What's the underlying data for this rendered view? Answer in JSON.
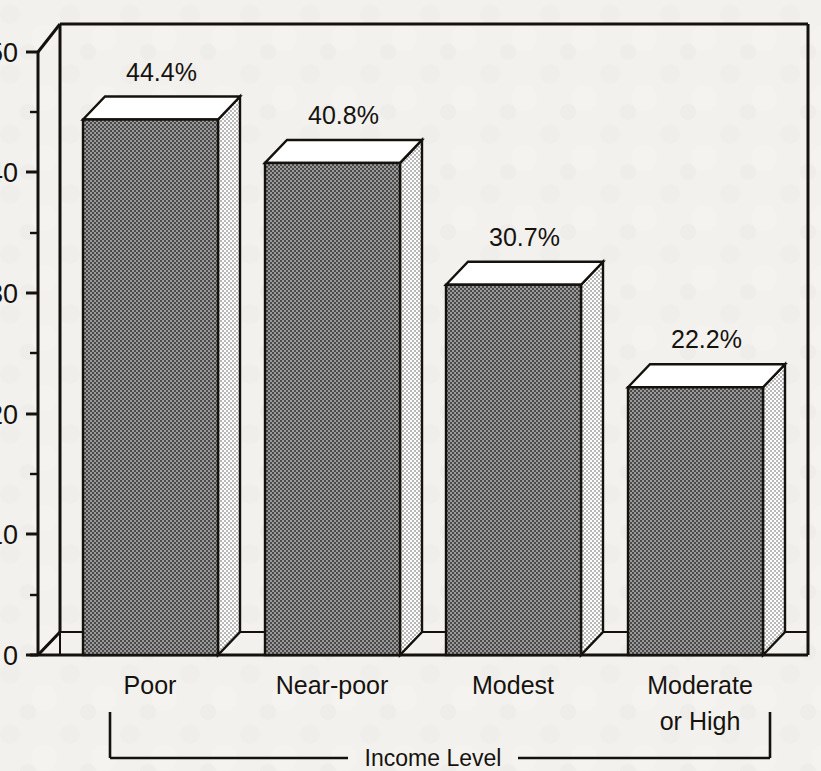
{
  "chart_data": {
    "type": "bar",
    "title": "",
    "subtitle": "",
    "xlabel": "Income Level",
    "ylabel": "",
    "categories": [
      "Poor",
      "Near-poor",
      "Modest",
      "Moderate or High"
    ],
    "category_lines": [
      [
        "Poor"
      ],
      [
        "Near-poor"
      ],
      [
        "Modest"
      ],
      [
        "Moderate",
        "or High"
      ]
    ],
    "values": [
      44.4,
      40.8,
      30.7,
      22.2
    ],
    "data_labels": [
      "44.4%",
      "40.8%",
      "30.7%",
      "22.2%"
    ],
    "ylim": [
      0,
      50
    ],
    "y_major_ticks": [
      0,
      10,
      20,
      30,
      40,
      50
    ],
    "y_major_tick_labels": [
      "0",
      "10",
      "20",
      "30",
      "40",
      "50"
    ],
    "y_minor_ticks": [
      5,
      15,
      25,
      35,
      45
    ],
    "grid": false,
    "legend": null,
    "style": "3d-bar",
    "colors": {
      "bar_front": "#808080",
      "bar_top": "#ffffff",
      "bar_side": "#c9c9c9",
      "outline": "#15120e",
      "background": "#f2f1ee",
      "text": "#16130f"
    }
  },
  "axis": {
    "bracket_label": "Income Level"
  }
}
